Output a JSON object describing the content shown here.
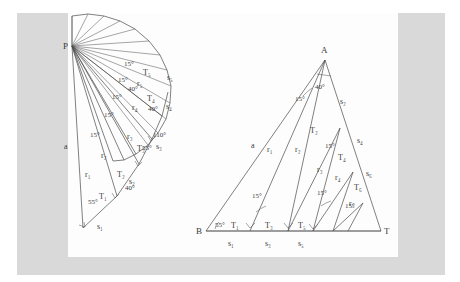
{
  "document": {
    "type": "scanned-geometry-figure",
    "background_color": "#ffffff",
    "panel_color": "#d9d9d9",
    "page_color": "#fdfdfd",
    "ink_color": "#4a4a4a"
  },
  "figures": [
    {
      "id": "left-figure",
      "name": "spiral-fan-construction",
      "description": "Fan of rays from apex P forming a chain of right triangles",
      "apex_label": "P",
      "vertices": [
        {
          "label": "P",
          "x": 72,
          "y": 46
        }
      ],
      "angle_labels": [
        "55°",
        "15°",
        "15°",
        "15°",
        "15°",
        "15°",
        "15°",
        "40°",
        "110°",
        "55°",
        "40°"
      ],
      "side_labels": [
        "a",
        "r₁",
        "r₂",
        "r₃",
        "r₄",
        "r₅"
      ],
      "triangle_labels": [
        "T₁",
        "T₂",
        "T₃",
        "T₄",
        "T₅"
      ],
      "segment_labels": [
        "s₁",
        "s₂",
        "s₃",
        "s₄",
        "s₅"
      ],
      "ray_count": 16
    },
    {
      "id": "right-figure",
      "name": "subdivided-triangle-construction",
      "description": "Triangle ABT subdivided by cevians from A into triangles T1..T6 on base segments s1..s6",
      "vertices": [
        {
          "label": "A",
          "x": 325,
          "y": 60
        },
        {
          "label": "B",
          "x": 206,
          "y": 231
        },
        {
          "label": "T",
          "x": 381,
          "y": 231
        }
      ],
      "angle_labels": [
        "55°",
        "40°",
        "15°",
        "15°",
        "15°",
        "15°",
        "15°"
      ],
      "side_labels": [
        "a",
        "r₁",
        "r₂",
        "r₃",
        "r₄",
        "r₅"
      ],
      "triangle_labels": [
        "T₁",
        "T₂",
        "T₃",
        "T₄",
        "T₅",
        "T₆"
      ],
      "segment_labels": [
        "s₁",
        "s₂",
        "s₃",
        "s₄",
        "s₅",
        "s₆"
      ],
      "base_label_left": "B",
      "base_label_right": "T",
      "apex_label": "A"
    }
  ],
  "labels": {
    "left": {
      "P": "P",
      "a": "a",
      "r1": "r₁",
      "r2": "r₂",
      "r3": "r₃",
      "r4": "r₄",
      "r5": "r₅",
      "T1": "T₁",
      "T2": "T₂",
      "T3": "T₃",
      "T4": "T₄",
      "T5": "T₅",
      "s1": "s₁",
      "s2": "s₂",
      "s3": "s₃",
      "s4": "s₄",
      "s5": "s₅",
      "ang55a": "55°",
      "ang15a": "15°",
      "ang15b": "15°",
      "ang15c": "15°",
      "ang15d": "15°",
      "ang15e": "15°",
      "ang40a": "40°",
      "ang40b": "40°",
      "ang110": "110°",
      "ang55b": "55°"
    },
    "right": {
      "A": "A",
      "B": "B",
      "T": "T",
      "a": "a",
      "r1": "r₁",
      "r2": "r₂",
      "r3": "r₃",
      "r4": "r₄",
      "r5": "r₅",
      "T1": "T₁",
      "T2": "T₂",
      "T3": "T₃",
      "T4": "T₄",
      "T5": "T₅",
      "T6": "T₆",
      "s1": "s₁",
      "s2": "s₂",
      "s3": "s₃",
      "s4": "s₄",
      "s5": "s₅",
      "s6": "s₆",
      "ang55": "55°",
      "ang40": "40°",
      "ang15a": "15°",
      "ang15b": "15°",
      "ang15c": "15°",
      "ang15d": "15°",
      "ang15e": "15°"
    }
  }
}
